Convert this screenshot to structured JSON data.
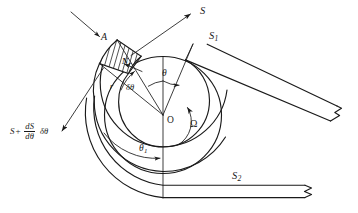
{
  "figure": {
    "kind": "engineering-diagram",
    "background_color": "#ffffff",
    "line_color": "#1a1a1a"
  },
  "labels": {
    "force_s_in": "S",
    "force_s_out": {
      "base": "S",
      "plus": "+",
      "numerator": "dS",
      "denominator": "dθ",
      "tail": "δθ"
    },
    "element_a": "A",
    "normal_force": "N",
    "normal_force_sub": "r",
    "radius": "r",
    "angle_theta": "θ",
    "angle_delta_theta": "δθ",
    "angle_theta_1": "θ",
    "angle_theta_1_sub": "1",
    "centre": "O",
    "angular_velocity": "Ω",
    "tension_s1": "S",
    "tension_s1_sub": "1",
    "tension_s2": "S",
    "tension_s2_sub": "2"
  }
}
